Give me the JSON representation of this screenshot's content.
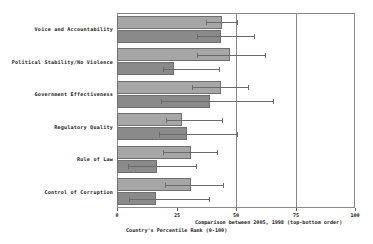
{
  "chart_data": {
    "type": "bar",
    "orientation": "horizontal",
    "title": "",
    "subtitle": "",
    "xlabel": "Country's Percentile Rank (0-100)",
    "xlabel_secondary": "Comparison between 2005, 1998 (top-bottom order)",
    "ylabel": "",
    "xlim": [
      0,
      100
    ],
    "xticks": [
      0,
      25,
      50,
      75,
      100
    ],
    "xticklabels": [
      "0",
      "25",
      "50",
      "75",
      "100"
    ],
    "gridlines": [
      50,
      75
    ],
    "grid": true,
    "legend": "none",
    "categories": [
      "Voice and Accountability",
      "Political Stability/No Violence",
      "Government Effectiveness",
      "Regulatory Quality",
      "Rule of Law",
      "Control of Corruption"
    ],
    "series": [
      {
        "name": "2005",
        "color": "#a6a6a6",
        "values": [
          44.0,
          47.5,
          43.5,
          27.5,
          31.0,
          31.0
        ],
        "err_low": [
          37.5,
          33.5,
          31.5,
          20.5,
          19.5,
          20.0
        ],
        "err_high": [
          50.5,
          62.0,
          55.0,
          44.0,
          42.0,
          44.5
        ]
      },
      {
        "name": "1998",
        "color": "#8a8a8a",
        "values": [
          43.5,
          24.0,
          39.0,
          29.5,
          17.0,
          16.5
        ],
        "err_low": [
          33.5,
          19.5,
          18.5,
          17.5,
          4.5,
          5.0
        ],
        "err_high": [
          57.5,
          43.0,
          65.5,
          50.5,
          33.0,
          38.5
        ]
      }
    ]
  },
  "axis": {
    "tick_0": "0",
    "tick_25": "25",
    "tick_50": "50",
    "tick_75": "75",
    "tick_100": "100",
    "caption_line1": "Comparison between 2005, 1998 (top-bottom order)",
    "caption_line2": "Country's Percentile Rank (0-100)"
  }
}
